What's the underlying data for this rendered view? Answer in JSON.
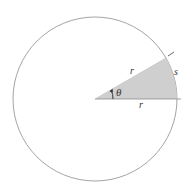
{
  "diagram": {
    "labels": {
      "radius_upper": "r",
      "radius_lower": "r",
      "arc": "s",
      "angle": "θ"
    },
    "geometry": {
      "center": [
        95,
        99
      ],
      "radius": 82,
      "sector_angle_deg": 30
    },
    "colors": {
      "circle_stroke": "#9a9a9a",
      "sector_fill": "#cfcfcf",
      "line": "#8a8a8a",
      "text": "#333333"
    }
  }
}
